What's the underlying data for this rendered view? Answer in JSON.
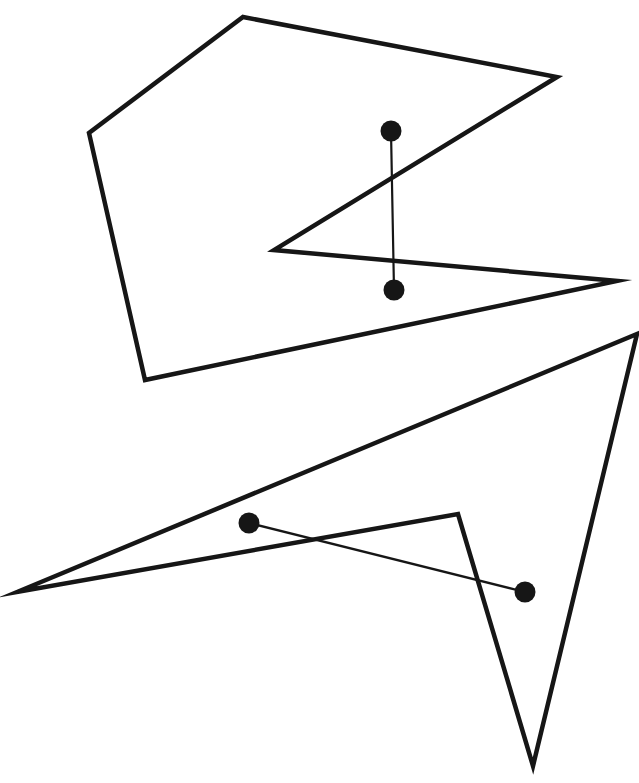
{
  "canvas": {
    "width": 639,
    "height": 783,
    "background": "#ffffff"
  },
  "figures": [
    {
      "name": "upper-polygon",
      "type": "polygon",
      "stroke": "#161616",
      "stroke_width": 4.5,
      "points": [
        [
          243,
          17
        ],
        [
          557,
          77
        ],
        [
          274,
          250
        ],
        [
          617,
          281
        ],
        [
          145,
          380
        ],
        [
          89,
          133
        ]
      ],
      "segment": {
        "name": "upper-segment",
        "from": [
          391,
          131
        ],
        "to": [
          394,
          290
        ],
        "stroke_width": 2.2,
        "endpoint_radius": 10.5,
        "color": "#161616"
      }
    },
    {
      "name": "lower-polygon",
      "type": "polygon",
      "stroke": "#161616",
      "stroke_width": 4.5,
      "points": [
        [
          637,
          334
        ],
        [
          533,
          766
        ],
        [
          458,
          514
        ],
        [
          17,
          592
        ]
      ],
      "segment": {
        "name": "lower-segment",
        "from": [
          249,
          523
        ],
        "to": [
          525,
          592
        ],
        "stroke_width": 2.2,
        "endpoint_radius": 10.5,
        "color": "#161616"
      }
    }
  ]
}
